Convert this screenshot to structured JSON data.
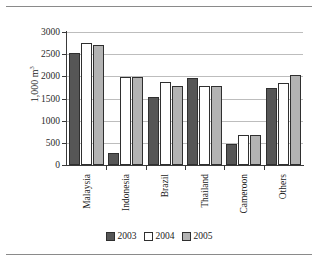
{
  "chart_data": {
    "type": "bar",
    "title": "",
    "xlabel": "",
    "ylabel": "1,000 m",
    "ylabel_sup": "3",
    "categories": [
      "Malaysia",
      "Indonesia",
      "Brazil",
      "Thailand",
      "Cameroon",
      "Others"
    ],
    "series": [
      {
        "name": "2003",
        "color": "#565656",
        "values": [
          2520,
          270,
          1540,
          1970,
          475,
          1730
        ]
      },
      {
        "name": "2004",
        "color": "#ffffff",
        "values": [
          2750,
          1990,
          1870,
          1780,
          670,
          1840
        ]
      },
      {
        "name": "2005",
        "color": "#b3b3b3",
        "values": [
          2700,
          1990,
          1790,
          1780,
          670,
          2040
        ]
      }
    ],
    "ylim": [
      0,
      3000
    ],
    "yticks": [
      0,
      500,
      1000,
      1500,
      2000,
      2500,
      3000
    ],
    "ytick_labels": [
      "0",
      "500",
      "1000",
      "1500",
      "2000",
      "2500",
      "3000"
    ],
    "grid": true,
    "grid_axis": "y",
    "legend_position": "bottom"
  },
  "legend": {
    "items": [
      {
        "label": "2003"
      },
      {
        "label": "2004"
      },
      {
        "label": "2005"
      }
    ]
  }
}
